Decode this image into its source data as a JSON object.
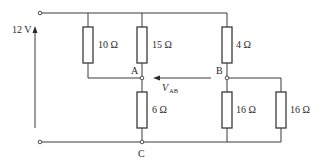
{
  "diagram": {
    "type": "circuit-schematic",
    "source": {
      "label": "12 V",
      "direction": "up"
    },
    "resistors": [
      {
        "id": "R1",
        "label": "10 Ω",
        "from": "top-rail",
        "to": "A"
      },
      {
        "id": "R2",
        "label": "15 Ω",
        "from": "top-rail",
        "to": "A"
      },
      {
        "id": "R3",
        "label": "4 Ω",
        "from": "top-rail",
        "to": "B"
      },
      {
        "id": "R4",
        "label": "6 Ω",
        "from": "A",
        "to": "C"
      },
      {
        "id": "R5",
        "label": "16 Ω",
        "from": "B",
        "to": "bottom-rail"
      },
      {
        "id": "R6",
        "label": "16 Ω",
        "from": "B",
        "to": "bottom-rail"
      }
    ],
    "nodes": {
      "A": "A",
      "B": "B",
      "C": "C"
    },
    "voltage_label": {
      "main": "V",
      "subscript": "AB",
      "arrow": "from B to A"
    },
    "colors": {
      "line": "#3a3a3a",
      "text": "#2a2a2a",
      "background": "#ffffff"
    }
  }
}
